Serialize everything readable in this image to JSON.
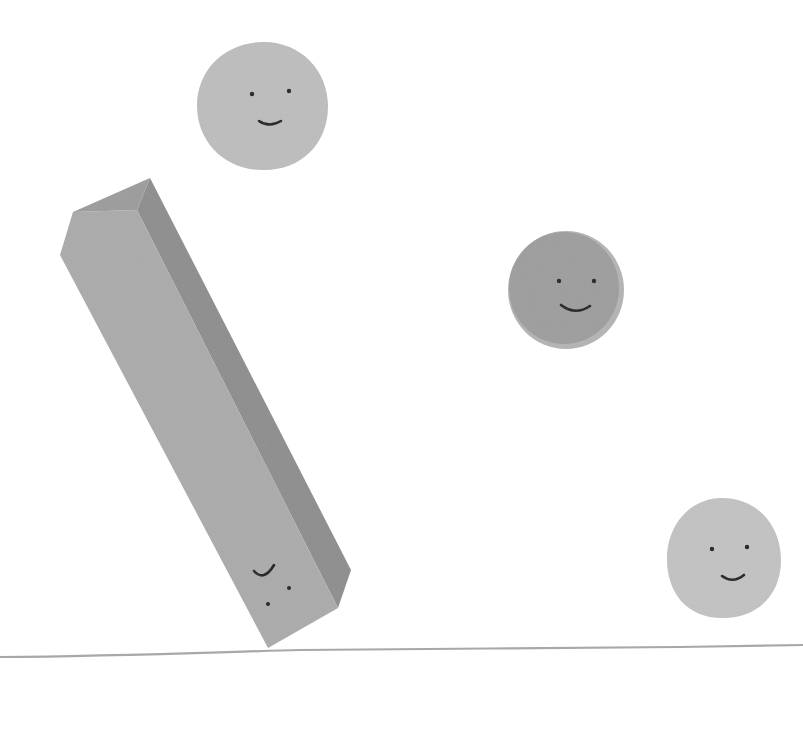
{
  "scene": {
    "description": "Paper-cut illustration: a tall tilted rectangular block and three round smiling circles above a hand-drawn ground line",
    "background": "#ffffff",
    "ground_line": {
      "color": "#a8a8a8"
    },
    "bar": {
      "front_color": "#a9a9a9",
      "side_color": "#8c8c8c",
      "face": "upside-down smiling face"
    },
    "circles": [
      {
        "name": "top-circle",
        "color": "#bdbdbd",
        "face": "smile"
      },
      {
        "name": "middle-circle",
        "color": "#9e9e9e",
        "rim_color": "#b4b4b4",
        "face": "smile"
      },
      {
        "name": "bottom-right-circle",
        "color": "#c2c2c2",
        "face": "smile"
      }
    ],
    "ink_color": "#1e1e1e"
  }
}
